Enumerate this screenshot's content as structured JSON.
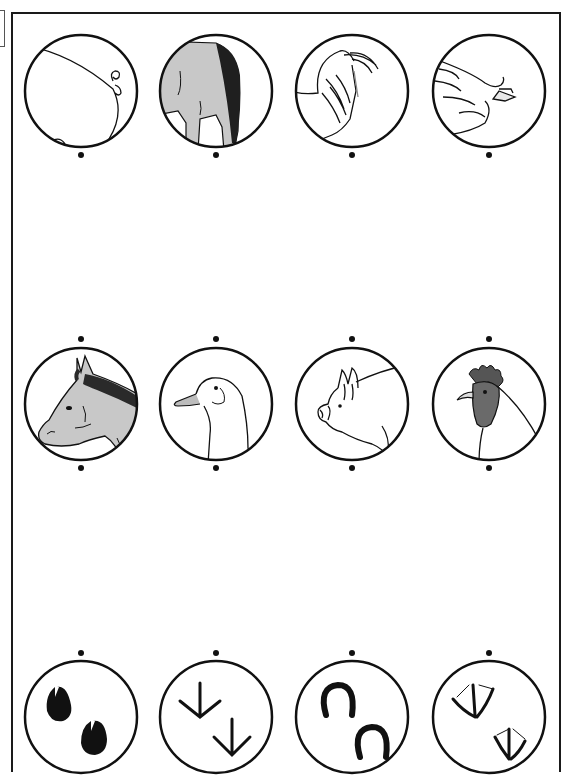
{
  "worksheet": {
    "type": "matching-activity",
    "rows": [
      {
        "name": "tails",
        "items": [
          {
            "id": "pig-tail",
            "label": "pig tail",
            "icon": "pig-tail-icon"
          },
          {
            "id": "horse-tail",
            "label": "horse tail",
            "icon": "horse-tail-icon"
          },
          {
            "id": "rooster-tail",
            "label": "rooster tail",
            "icon": "rooster-tail-icon"
          },
          {
            "id": "goose-tail",
            "label": "goose tail",
            "icon": "goose-tail-icon"
          }
        ]
      },
      {
        "name": "heads",
        "items": [
          {
            "id": "horse-head",
            "label": "horse head",
            "icon": "horse-head-icon"
          },
          {
            "id": "goose-head",
            "label": "goose head",
            "icon": "goose-head-icon"
          },
          {
            "id": "pig-head",
            "label": "pig head",
            "icon": "pig-head-icon"
          },
          {
            "id": "rooster-head",
            "label": "rooster head",
            "icon": "rooster-head-icon"
          }
        ]
      },
      {
        "name": "footprints",
        "items": [
          {
            "id": "pig-hoofprints",
            "label": "pig hoof prints",
            "icon": "hoofprint-icon"
          },
          {
            "id": "chicken-footprints",
            "label": "chicken footprints",
            "icon": "bird-footprint-icon"
          },
          {
            "id": "horseshoe-prints",
            "label": "horseshoe prints",
            "icon": "horseshoe-icon"
          },
          {
            "id": "goose-footprints",
            "label": "webbed footprints",
            "icon": "webbed-footprint-icon"
          }
        ]
      }
    ],
    "colors": {
      "outline": "#111111",
      "horse_gray": "#c8c8c8",
      "mane_dark": "#2a2a2a",
      "rooster_gray": "#6a6a6a",
      "background": "#ffffff"
    }
  }
}
